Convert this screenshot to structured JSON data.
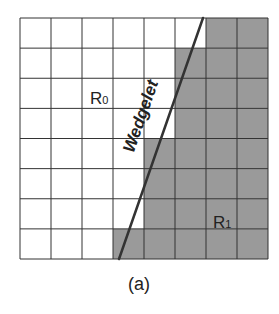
{
  "figure": {
    "caption": "(a)",
    "grid": {
      "rows": 8,
      "cols": 8,
      "left": 20,
      "top": 18,
      "right": 268,
      "bottom": 259,
      "line_color": "#333333",
      "shaded_color": "#9a9a9a",
      "unshaded_color": "#ffffff",
      "shaded_start_col_by_row": [
        6,
        5,
        5,
        5,
        4,
        4,
        4,
        3
      ]
    },
    "wedgelet_line": {
      "label": "Wedgelet",
      "x1": 203,
      "y1": 18,
      "x2": 119,
      "y2": 259,
      "color": "#333333"
    },
    "regions": [
      {
        "name": "R",
        "subscript": "0",
        "x": 90,
        "y": 104
      },
      {
        "name": "R",
        "subscript": "1",
        "x": 213,
        "y": 228
      }
    ]
  }
}
